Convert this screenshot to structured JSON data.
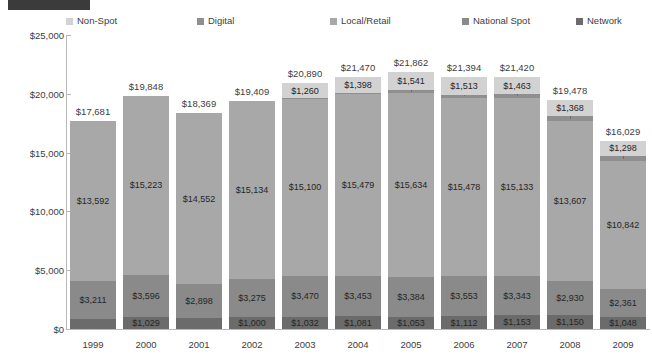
{
  "legend": {
    "items": [
      {
        "label": "Non-Spot",
        "color": "#d2d2d2",
        "x": 66
      },
      {
        "label": "Digital",
        "color": "#8f8f8f",
        "x": 197
      },
      {
        "label": "Local/Retail",
        "color": "#a8a8a8",
        "x": 330
      },
      {
        "label": "National Spot",
        "color": "#8a8a8a",
        "x": 462
      },
      {
        "label": "Network",
        "color": "#6b6b6b",
        "x": 576
      }
    ]
  },
  "axis": {
    "y_ticks": [
      "$0",
      "$5,000",
      "$10,000",
      "$15,000",
      "$20,000",
      "$25,000"
    ],
    "y_min": 0,
    "y_max": 25000,
    "y_step": 5000
  },
  "chart_data": {
    "type": "bar",
    "title": "",
    "xlabel": "",
    "ylabel": "",
    "ylim": [
      0,
      25000
    ],
    "grid": false,
    "legend_position": "top",
    "stacked": true,
    "categories": [
      "1999",
      "2000",
      "2001",
      "2002",
      "2003",
      "2004",
      "2005",
      "2006",
      "2007",
      "2008",
      "2009"
    ],
    "series": [
      {
        "name": "Network",
        "color": "#6b6b6b",
        "values": [
          878,
          1029,
          919,
          1000,
          1032,
          1081,
          1053,
          1112,
          1153,
          1150,
          1048
        ],
        "labels": [
          "$878",
          "$1,029",
          "$919",
          "$1,000",
          "$1,032",
          "$1,081",
          "$1,053",
          "$1,112",
          "$1,153",
          "$1,150",
          "$1,048"
        ]
      },
      {
        "name": "National Spot",
        "color": "#8a8a8a",
        "values": [
          3211,
          3596,
          2898,
          3275,
          3470,
          3453,
          3384,
          3553,
          3343,
          2930,
          2361
        ],
        "labels": [
          "$3,211",
          "$3,596",
          "$2,898",
          "$3,275",
          "$3,470",
          "$3,453",
          "$3,384",
          "$3,553",
          "$3,343",
          "$2,930",
          "$2,361"
        ]
      },
      {
        "name": "Local/Retail",
        "color": "#a8a8a8",
        "values": [
          13592,
          15223,
          14552,
          15134,
          15100,
          15479,
          15634,
          15478,
          15133,
          13607,
          10842
        ],
        "labels": [
          "$13,592",
          "$15,223",
          "$14,552",
          "$15,134",
          "$15,100",
          "$15,479",
          "$15,634",
          "$15,478",
          "$15,133",
          "$13,607",
          "$10,842"
        ]
      },
      {
        "name": "Digital",
        "color": "#8f8f8f",
        "values": [
          0,
          0,
          0,
          0,
          28,
          59,
          250,
          278,
          328,
          423,
          480
        ],
        "labels": [
          "",
          "",
          "",
          "",
          "$28",
          "$59",
          "$250",
          "$278",
          "$328",
          "$423",
          "$480"
        ]
      },
      {
        "name": "Non-Spot",
        "color": "#d2d2d2",
        "values": [
          0,
          0,
          0,
          0,
          1260,
          1398,
          1541,
          1513,
          1463,
          1368,
          1298
        ],
        "labels": [
          "",
          "",
          "",
          "",
          "$1,260",
          "$1,398",
          "$1,541",
          "$1,513",
          "$1,463",
          "$1,368",
          "$1,298"
        ]
      }
    ],
    "totals": [
      17681,
      19848,
      18369,
      19409,
      20890,
      21470,
      21862,
      21394,
      21420,
      19478,
      16029
    ],
    "total_labels": [
      "$17,681",
      "$19,848",
      "$18,369",
      "$19,409",
      "$20,890",
      "$21,470",
      "$21,862",
      "$21,394",
      "$21,420",
      "$19,478",
      "$16,029"
    ]
  }
}
